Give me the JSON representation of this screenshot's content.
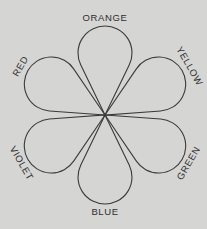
{
  "diagram": {
    "center": {
      "x": 105,
      "y": 115
    },
    "background": "#d5d5d4",
    "stroke": "#3a3a3a",
    "petals": [
      {
        "name": "orange",
        "label": "ORANGE",
        "angle": -90
      },
      {
        "name": "yellow",
        "label": "YELLOW",
        "angle": -30
      },
      {
        "name": "green",
        "label": "GREEN",
        "angle": 30
      },
      {
        "name": "blue",
        "label": "BLUE",
        "angle": 90
      },
      {
        "name": "violet",
        "label": "VIOLET",
        "angle": 150
      },
      {
        "name": "red",
        "label": "RED",
        "angle": 210
      }
    ]
  }
}
